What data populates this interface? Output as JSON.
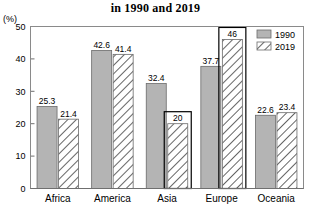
{
  "chart_data": {
    "type": "bar",
    "title": "in 1990 and 2019",
    "xlabel": "",
    "ylabel": "(%)",
    "ylim": [
      0,
      50
    ],
    "yticks": [
      0,
      10,
      20,
      30,
      40,
      50
    ],
    "grid": false,
    "legend_position": "top-right",
    "categories": [
      "Africa",
      "America",
      "Asia",
      "Europe",
      "Oceania"
    ],
    "series": [
      {
        "name": "1990",
        "values": [
          25.3,
          42.6,
          32.4,
          37.7,
          22.6
        ]
      },
      {
        "name": "2019",
        "values": [
          21.4,
          41.4,
          20,
          46,
          23.4
        ]
      }
    ],
    "value_labels": {
      "1990": [
        "25.3",
        "42.6",
        "32.4",
        "37.7",
        "22.6"
      ],
      "2019": [
        "21.4",
        "41.4",
        "20",
        "46",
        "23.4"
      ]
    },
    "highlights": [
      {
        "category": "Asia",
        "series": "2019"
      },
      {
        "category": "Europe",
        "series": "2019"
      }
    ]
  },
  "legend": {
    "items": [
      {
        "label": "1990",
        "swatch": "solid-gray-swatch"
      },
      {
        "label": "2019",
        "swatch": "hatched-swatch"
      }
    ]
  },
  "colors": {
    "bar_1990_fill": "#b4b4b4",
    "bar_2019_fill": "#ffffff",
    "bar_stroke": "#6b6b6b",
    "hatch_stroke": "#4a4a4a",
    "highlight_stroke": "#000000",
    "axis": "#6f6f6f",
    "frame": "#8a8a8a",
    "background": "#ffffff"
  }
}
